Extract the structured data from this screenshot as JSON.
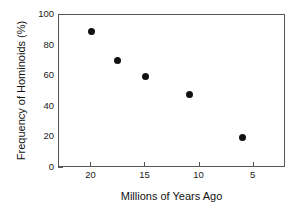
{
  "chart_data": {
    "type": "scatter",
    "title": "",
    "xlabel": "Millions of Years Ago",
    "ylabel": "Frequency of Hominoids (%)",
    "xlim": [
      23,
      2
    ],
    "ylim": [
      0,
      100
    ],
    "x_reversed": true,
    "grid": false,
    "legend": null,
    "xticks": [
      20,
      15,
      10,
      5,
      0
    ],
    "xtick_labels": [
      "20",
      "15",
      "10",
      "5",
      "0"
    ],
    "yticks": [
      0,
      20,
      40,
      60,
      80,
      100
    ],
    "ytick_labels": [
      "0",
      "20",
      "40",
      "60",
      "80",
      "100"
    ],
    "marker": "filled-circle",
    "marker_color": "#111111",
    "x": [
      20.0,
      17.6,
      15.0,
      10.9,
      6.0,
      0.1
    ],
    "values": [
      89,
      70,
      60,
      48,
      20,
      15
    ],
    "points": [
      {
        "x": 20.0,
        "y": 89
      },
      {
        "x": 17.6,
        "y": 70
      },
      {
        "x": 15.0,
        "y": 60
      },
      {
        "x": 10.9,
        "y": 48
      },
      {
        "x": 6.0,
        "y": 20
      },
      {
        "x": 0.1,
        "y": 15
      }
    ]
  },
  "axes": {
    "frame_color": "#555555",
    "background": "#ffffff"
  }
}
